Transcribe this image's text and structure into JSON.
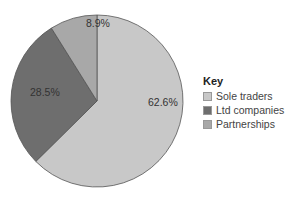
{
  "chart_data": {
    "type": "pie",
    "title": "",
    "categories": [
      "Sole traders",
      "Ltd companies",
      "Partnerships"
    ],
    "values": [
      62.6,
      28.5,
      8.9
    ],
    "labels": [
      "62.6%",
      "28.5%",
      "8.9%"
    ],
    "colors": [
      "#c8c8c8",
      "#6e6e6e",
      "#a8a8a8"
    ],
    "start_angle_deg": 0,
    "direction": "clockwise",
    "legend": {
      "title": "Key",
      "position": "right"
    }
  }
}
